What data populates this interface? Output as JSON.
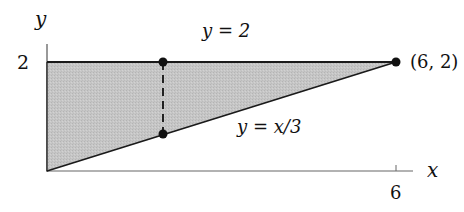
{
  "diagram": {
    "axes": {
      "x_label": "x",
      "y_label": "y",
      "x_tick_label": "6",
      "y_tick_label": "2"
    },
    "curves": {
      "top_label": "y = 2",
      "bottom_label": "y = x/3"
    },
    "points": {
      "vertex_label": "(6, 2)"
    },
    "colors": {
      "fill": "#c4c4c4",
      "stroke": "#1a1a1a",
      "axis": "#555555"
    }
  }
}
